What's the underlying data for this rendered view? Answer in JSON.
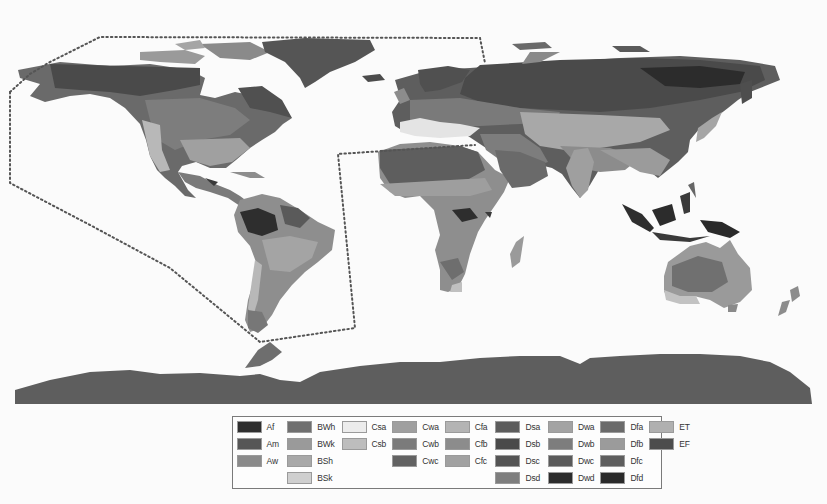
{
  "map": {
    "title": "",
    "projection": "equirectangular world map",
    "annotation": "dotted outline enclosing the Americas and western Atlantic",
    "ocean_color": "#fbfbfb"
  },
  "legend": {
    "columns": [
      [
        {
          "code": "Af",
          "color": "#2e2e2e"
        },
        {
          "code": "Am",
          "color": "#565656"
        },
        {
          "code": "Aw",
          "color": "#8a8a8a"
        }
      ],
      [
        {
          "code": "BWh",
          "color": "#6f6f6f"
        },
        {
          "code": "BWk",
          "color": "#9a9a9a"
        },
        {
          "code": "BSh",
          "color": "#a8a8a8"
        },
        {
          "code": "BSk",
          "color": "#cfcfcf"
        }
      ],
      [
        {
          "code": "Csa",
          "color": "#ececec"
        },
        {
          "code": "Csb",
          "color": "#bdbdbd"
        }
      ],
      [
        {
          "code": "Cwa",
          "color": "#9f9f9f"
        },
        {
          "code": "Cwb",
          "color": "#7b7b7b"
        },
        {
          "code": "Cwc",
          "color": "#626262"
        }
      ],
      [
        {
          "code": "Cfa",
          "color": "#b4b4b4"
        },
        {
          "code": "Cfb",
          "color": "#8c8c8c"
        },
        {
          "code": "Cfc",
          "color": "#a1a1a1"
        }
      ],
      [
        {
          "code": "Dsa",
          "color": "#5c5c5c"
        },
        {
          "code": "Dsb",
          "color": "#4a4a4a"
        },
        {
          "code": "Dsc",
          "color": "#545454"
        },
        {
          "code": "Dsd",
          "color": "#7e7e7e"
        }
      ],
      [
        {
          "code": "Dwa",
          "color": "#a3a3a3"
        },
        {
          "code": "Dwb",
          "color": "#7d7d7d"
        },
        {
          "code": "Dwc",
          "color": "#5a5a5a"
        },
        {
          "code": "Dwd",
          "color": "#2c2c2c"
        }
      ],
      [
        {
          "code": "Dfa",
          "color": "#6a6a6a"
        },
        {
          "code": "Dfb",
          "color": "#9b9b9b"
        },
        {
          "code": "Dfc",
          "color": "#5e5e5e"
        },
        {
          "code": "Dfd",
          "color": "#2a2a2a"
        }
      ],
      [
        {
          "code": "ET",
          "color": "#b0b0b0"
        },
        {
          "code": "EF",
          "color": "#4c4c4c"
        }
      ]
    ]
  }
}
